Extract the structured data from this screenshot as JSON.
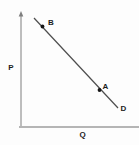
{
  "figure": {
    "background": "#fdfdfd",
    "colors": {
      "y_axis": "#7e7e7e",
      "x_axis": "#b5b5b5",
      "curve": "#4d4d4d",
      "point": "#161616",
      "text": "#1c1c1c"
    }
  },
  "chart_data": {
    "type": "line",
    "title": "",
    "xlabel": "Q",
    "ylabel": "P",
    "x_ticks": [],
    "y_ticks": [],
    "grid": false,
    "legend": "none",
    "series": [
      {
        "name": "D",
        "points_norm": [
          {
            "x": 0.11,
            "y": 0.965
          },
          {
            "x": 0.82,
            "y": 0.168
          }
        ]
      }
    ],
    "marked_points": [
      {
        "label": "B",
        "x_norm": 0.182,
        "y_norm": 0.889
      },
      {
        "label": "A",
        "x_norm": 0.665,
        "y_norm": 0.327
      }
    ],
    "geometry_px": {
      "canvas": {
        "width": 139,
        "height": 145
      },
      "y_axis": {
        "x": 21,
        "y1": 14,
        "y2": 127
      },
      "y_axis_arrow": "21,11 18.7,16.5 23.3,16.5",
      "x_axis": {
        "y": 127,
        "x1": 19,
        "x2": 139
      },
      "demand_line": {
        "x1": 34,
        "y1": 18,
        "x2": 118,
        "y2": 108
      },
      "point_b": {
        "cx": 42.5,
        "cy": 26.5,
        "r": 1.9,
        "label_x": 51,
        "label_y": 25
      },
      "point_a": {
        "cx": 99.5,
        "cy": 90,
        "r": 1.9,
        "label_x": 105.5,
        "label_y": 88.5
      },
      "curve_label": {
        "x": 123.5,
        "y": 110.5
      },
      "y_label": {
        "x": 11,
        "y": 69.5
      },
      "x_label": {
        "x": 82.5,
        "y": 136.5
      }
    }
  }
}
